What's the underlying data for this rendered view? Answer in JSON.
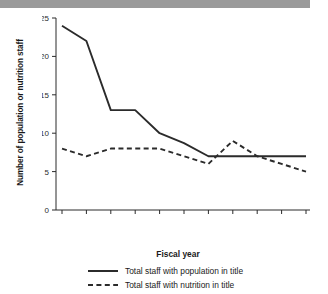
{
  "header": {
    "bar_color": "#9a9a9a"
  },
  "chart_data": {
    "type": "line",
    "title": "",
    "xlabel": "Fiscal year",
    "ylabel": "Number of population or nutrition staff",
    "categories": [
      "1997",
      "1998",
      "1999",
      "2000",
      "2001",
      "2002",
      "2003",
      "2004",
      "2005",
      "2006",
      "2007"
    ],
    "x": [
      1997,
      1998,
      1999,
      2000,
      2001,
      2002,
      2003,
      2004,
      2005,
      2006,
      2007
    ],
    "series": [
      {
        "name": "Total staff with population in title",
        "style": "solid",
        "color": "#2b2b2b",
        "values": [
          24,
          22,
          13,
          13,
          10,
          8.7,
          7,
          7,
          7,
          7,
          7
        ]
      },
      {
        "name": "Total staff with nutrition in title",
        "style": "dashed",
        "color": "#2b2b2b",
        "values": [
          8,
          7,
          8,
          8,
          8,
          7,
          6,
          9,
          7,
          6,
          5
        ]
      }
    ],
    "ylim": [
      0,
      25
    ],
    "yticks": [
      0,
      5,
      10,
      15,
      20,
      25
    ],
    "ytick_labels": [
      "0",
      "5",
      "10",
      "15",
      "20",
      "25"
    ],
    "xtick_labels": [
      "1997",
      "1998",
      "1999",
      "2000",
      "2001",
      "2002",
      "2003",
      "2004",
      "2005",
      "2006",
      "2007"
    ],
    "grid": false,
    "legend_position": "bottom"
  }
}
